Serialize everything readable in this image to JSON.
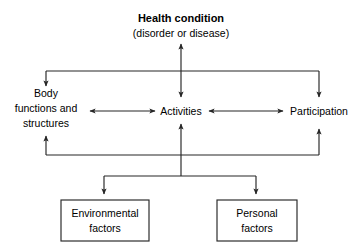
{
  "diagram": {
    "type": "flow-diagram",
    "background_color": "#ffffff",
    "line_color": "#262626",
    "text_color": "#000000"
  },
  "nodes": {
    "health_condition": {
      "label": "Health condition",
      "sublabel": "(disorder or disease)",
      "shape": "text",
      "bold": true
    },
    "body_functions": {
      "line1": "Body",
      "line2": "functions and",
      "line3": "structures",
      "shape": "text"
    },
    "activities": {
      "label": "Activities",
      "shape": "text"
    },
    "participation": {
      "label": "Participation",
      "shape": "text"
    },
    "environmental_factors": {
      "line1": "Environmental",
      "line2": "factors",
      "shape": "box"
    },
    "personal_factors": {
      "line1": "Personal",
      "line2": "factors",
      "shape": "box"
    }
  },
  "connectors": [
    {
      "name": "health-to-activities",
      "style": "double-arrow",
      "orientation": "vertical"
    },
    {
      "name": "health-rail-to-body-functions",
      "style": "arrow",
      "orientation": "vertical"
    },
    {
      "name": "health-rail-to-participation",
      "style": "arrow",
      "orientation": "vertical"
    },
    {
      "name": "body-functions-to-activities",
      "style": "double-arrow",
      "orientation": "horizontal"
    },
    {
      "name": "activities-to-participation",
      "style": "double-arrow",
      "orientation": "horizontal"
    },
    {
      "name": "lower-rail-to-body-functions",
      "style": "arrow",
      "orientation": "vertical"
    },
    {
      "name": "lower-rail-to-participation",
      "style": "arrow",
      "orientation": "vertical"
    },
    {
      "name": "contextual-rail-to-activities",
      "style": "arrow",
      "orientation": "vertical"
    },
    {
      "name": "rail-to-environmental-factors",
      "style": "arrow",
      "orientation": "vertical"
    },
    {
      "name": "rail-to-personal-factors",
      "style": "arrow",
      "orientation": "vertical"
    }
  ]
}
